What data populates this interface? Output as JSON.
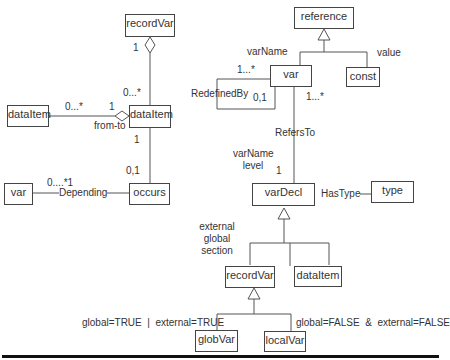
{
  "diagram": {
    "type": "UML class diagram",
    "classes": {
      "recordVar_top": "recordVar",
      "dataItem_left": "dataItem",
      "dataItem_center": "dataItem",
      "var_left": "var",
      "occurs": "occurs",
      "reference": "reference",
      "var": "var",
      "const": "const",
      "varDecl": "varDecl",
      "type": "type",
      "recordVar": "recordVar",
      "dataItem_right": "dataItem",
      "globVar": "globVar",
      "localVar": "localVar"
    },
    "labels": {
      "rv_agg_mult_top": "1",
      "rv_agg_mult_bottom": "0...*",
      "fromto_mult_left": "0...*",
      "fromto_mult_right": "1",
      "fromto_name": "from-to",
      "di_occurs_mult_top": "1",
      "di_occurs_mult_bottom": "0,1",
      "depending_mult": "0....*1",
      "depending_name": "Depending",
      "var_attr": "varName",
      "const_attr": "value",
      "redefined_mult_top": "1...*",
      "redefined_name": "RedefinedBy",
      "redefined_mult_bottom": "0,1",
      "refersto_mult_top": "1...*",
      "refersto_name": "RefersTo",
      "vardecl_attr1": "varName",
      "vardecl_attr2": "level",
      "refersto_mult_bottom": "1",
      "hastype_name": "HasType",
      "recordvar_attr1": "external",
      "recordvar_attr2": "global",
      "recordvar_attr3": "section",
      "globvar_constraint": "global=TRUE  |  external=TRUE",
      "localvar_constraint": "global=FALSE  &  external=FALSE"
    }
  }
}
